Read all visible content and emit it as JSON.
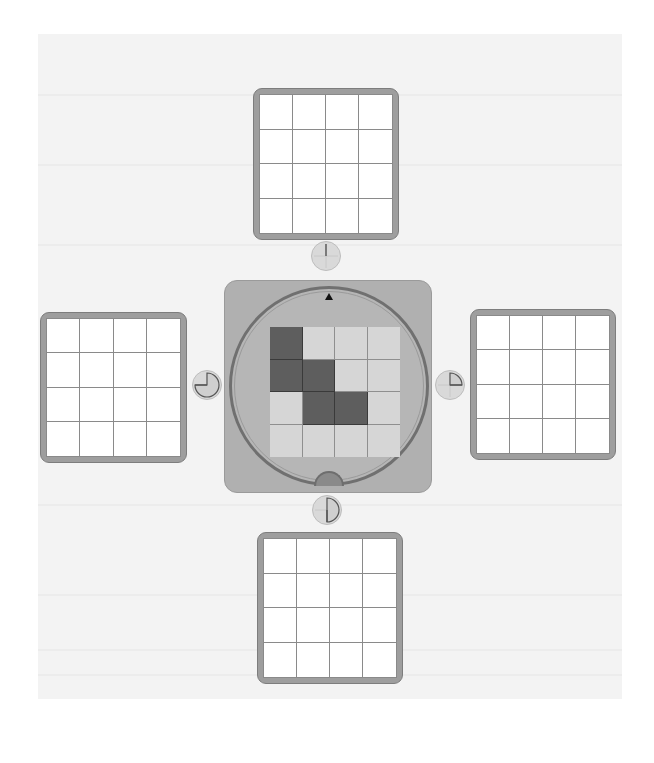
{
  "game": {
    "grid_size": 4,
    "colors": {
      "board_frame": "#9e9e9e",
      "board_cell": "#ffffff",
      "center_panel": "#b0b0b0",
      "piece_filled": "#5e5e5e",
      "piece_empty": "#d6d6d6",
      "button": "#d9d9d9"
    },
    "center_piece": {
      "rows": 4,
      "cols": 4,
      "cells": [
        [
          1,
          0,
          0,
          0
        ],
        [
          1,
          1,
          0,
          0
        ],
        [
          0,
          1,
          1,
          0
        ],
        [
          0,
          0,
          0,
          0
        ]
      ],
      "pointer_icon": "up-triangle",
      "handle": "bottom-notch"
    },
    "target_boards": [
      {
        "position": "top",
        "cells": [
          [
            0,
            0,
            0,
            0
          ],
          [
            0,
            0,
            0,
            0
          ],
          [
            0,
            0,
            0,
            0
          ],
          [
            0,
            0,
            0,
            0
          ]
        ]
      },
      {
        "position": "left",
        "cells": [
          [
            0,
            0,
            0,
            0
          ],
          [
            0,
            0,
            0,
            0
          ],
          [
            0,
            0,
            0,
            0
          ],
          [
            0,
            0,
            0,
            0
          ]
        ]
      },
      {
        "position": "right",
        "cells": [
          [
            0,
            0,
            0,
            0
          ],
          [
            0,
            0,
            0,
            0
          ],
          [
            0,
            0,
            0,
            0
          ],
          [
            0,
            0,
            0,
            0
          ]
        ]
      },
      {
        "position": "bottom",
        "cells": [
          [
            0,
            0,
            0,
            0
          ],
          [
            0,
            0,
            0,
            0
          ],
          [
            0,
            0,
            0,
            0
          ],
          [
            0,
            0,
            0,
            0
          ]
        ]
      }
    ],
    "rotation_buttons": [
      {
        "position": "top",
        "icon": "rotate-0-icon",
        "angle": 0
      },
      {
        "position": "left",
        "icon": "rotate-270-icon",
        "angle": 270
      },
      {
        "position": "right",
        "icon": "rotate-90-icon",
        "angle": 90
      },
      {
        "position": "bottom",
        "icon": "rotate-180-icon",
        "angle": 180
      }
    ]
  }
}
